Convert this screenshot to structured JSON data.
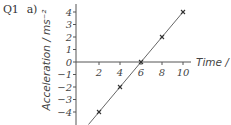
{
  "question": {
    "number": "Q1",
    "part": "a)"
  },
  "chart_data": {
    "type": "line",
    "title": "",
    "xlabel": "Time / s",
    "ylabel": "Acceleration / ms⁻²",
    "x_ticks": [
      2,
      4,
      6,
      8,
      10
    ],
    "y_ticks": [
      4,
      3,
      2,
      1,
      0,
      -1,
      -2,
      -3,
      -4
    ],
    "xlim": [
      0,
      10.5
    ],
    "ylim": [
      -5,
      4.5
    ],
    "grid": false,
    "legend": null,
    "series": [
      {
        "name": "acceleration",
        "marker": "x",
        "points": [
          {
            "x": 2,
            "y": -4
          },
          {
            "x": 4,
            "y": -2
          },
          {
            "x": 6,
            "y": 0
          },
          {
            "x": 8,
            "y": 2
          },
          {
            "x": 10,
            "y": 4
          }
        ],
        "line_extends_to": {
          "x": 1,
          "y": -5
        }
      }
    ],
    "colors": {
      "axis": "#555555",
      "line": "#555555",
      "marker": "#333333"
    }
  }
}
